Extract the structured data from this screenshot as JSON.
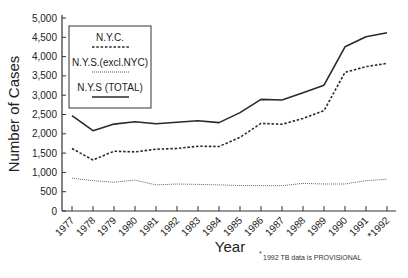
{
  "chart_data": {
    "type": "line",
    "title": "",
    "xlabel": "Year",
    "ylabel": "Number of Cases",
    "ylim": [
      0,
      5000
    ],
    "yticks": [
      0,
      500,
      1000,
      1500,
      2000,
      2500,
      3000,
      3500,
      4000,
      4500,
      5000
    ],
    "ytick_labels": [
      "0",
      "500",
      "1,000",
      "1,500",
      "2,000",
      "2,500",
      "3,000",
      "3,500",
      "4,000",
      "4,500",
      "5,000"
    ],
    "x": [
      "1977",
      "1978",
      "1979",
      "1980",
      "1981",
      "1982",
      "1983",
      "1984",
      "1985",
      "1986",
      "1987",
      "1988",
      "1989",
      "1990",
      "1991",
      "1992"
    ],
    "x_tick_labels": [
      "1977",
      "1978",
      "1979",
      "1980",
      "1981",
      "1982",
      "1983",
      "1984",
      "1985",
      "1986",
      "1987",
      "1988",
      "1989",
      "1990",
      "1991",
      "*1992"
    ],
    "series": [
      {
        "name": "N.Y.C.",
        "style": "dashed",
        "values": [
          1620,
          1320,
          1550,
          1530,
          1600,
          1620,
          1680,
          1670,
          1910,
          2270,
          2245,
          2400,
          2600,
          3590,
          3740,
          3825
        ]
      },
      {
        "name": "N.Y.S.(excl.NYC)",
        "style": "dotted",
        "values": [
          850,
          785,
          745,
          800,
          675,
          700,
          690,
          675,
          660,
          655,
          655,
          715,
          700,
          700,
          785,
          820
        ]
      },
      {
        "name": "N.Y.S (TOTAL)",
        "style": "solid",
        "values": [
          2470,
          2080,
          2250,
          2310,
          2260,
          2300,
          2340,
          2290,
          2550,
          2890,
          2875,
          3065,
          3260,
          4255,
          4515,
          4620
        ]
      }
    ],
    "legend_position": "upper-left (inside)",
    "grid": false,
    "annotations": [
      "*1992 TB data is PROVISIONAL"
    ]
  },
  "legend": {
    "items": [
      "N.Y.C.",
      "N.Y.S.(excl.NYC)",
      "N.Y.S (TOTAL)"
    ]
  },
  "footnote": {
    "marker": "*",
    "text": "1992 TB data is PROVISIONAL"
  },
  "colors": {
    "line": "#2a2a2a",
    "axis": "#333333"
  }
}
